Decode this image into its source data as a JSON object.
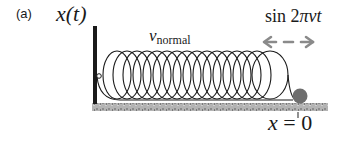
{
  "panel_label": "(a)",
  "wall_label": "x(t)",
  "spring_label": {
    "symbol": "v",
    "subscript": "normal"
  },
  "drive_label": {
    "prefix": "sin 2",
    "suffix": "πνt"
  },
  "origin_label": {
    "var": "x",
    "rest": " = 0"
  },
  "diagram": {
    "spring_loops": 16,
    "colors": {
      "wall": "#1a1a1a",
      "spring": "#1a1a1a",
      "ball": "#6e6e6e",
      "arrow": "#8a8a8a",
      "ground": "#a8a8a8"
    }
  }
}
